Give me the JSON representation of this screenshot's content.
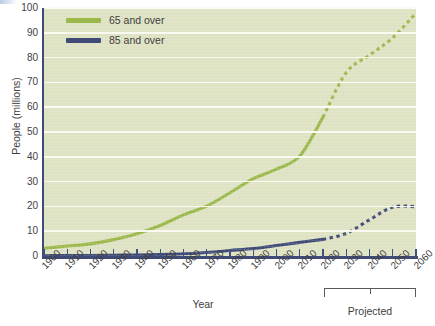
{
  "chart_data": {
    "type": "line",
    "title": "",
    "xlabel": "Year",
    "ylabel": "People (millions)",
    "xlim": [
      1900,
      2060
    ],
    "ylim": [
      0,
      100
    ],
    "grid": true,
    "legend_position": "top-left",
    "x": [
      1900,
      1910,
      1920,
      1930,
      1940,
      1950,
      1960,
      1970,
      1980,
      1990,
      2000,
      2010,
      2020,
      2030,
      2040,
      2050,
      2060
    ],
    "xticklabels": [
      "1900",
      "1910",
      "1920",
      "1930",
      "1940",
      "1950",
      "1960",
      "1970",
      "1980",
      "1990",
      "2000",
      "2010",
      "2020",
      "2030",
      "2040",
      "2050",
      "2060"
    ],
    "yticklabels": [
      "0",
      "10",
      "20",
      "30",
      "40",
      "50",
      "60",
      "70",
      "80",
      "90",
      "100"
    ],
    "yticks": [
      0,
      10,
      20,
      30,
      40,
      50,
      60,
      70,
      80,
      90,
      100
    ],
    "series": [
      {
        "name": "65 and over",
        "color": "#9bb84b",
        "values": [
          3.1,
          4.0,
          4.9,
          6.6,
          9.0,
          12.3,
          16.6,
          20.1,
          25.5,
          31.2,
          35.0,
          40.3,
          56.0,
          74.0,
          81.0,
          88.0,
          98.0
        ],
        "solid_until": 2020,
        "projected_from": 2020,
        "projected_style": "dotted"
      },
      {
        "name": "85 and over",
        "color": "#3f4a76",
        "values": [
          0.1,
          0.2,
          0.2,
          0.3,
          0.4,
          0.6,
          0.9,
          1.4,
          2.2,
          3.0,
          4.2,
          5.5,
          6.7,
          9.1,
          14.6,
          19.7,
          19.9
        ],
        "solid_until": 2020,
        "projected_from": 2020,
        "projected_style": "dotted"
      }
    ],
    "annotations": [
      {
        "text": "Projected",
        "span_start": 2020,
        "span_end": 2060,
        "type": "bracket"
      }
    ],
    "plot_background": "#dee2c3",
    "gridline_color": "#fbfbf4",
    "axis_color": "#3f4a76"
  },
  "legend": {
    "items": [
      {
        "label": "65 and over",
        "color": "#9bb84b"
      },
      {
        "label": "85 and over",
        "color": "#3f4a76"
      }
    ]
  },
  "axes": {
    "y_title": "People (millions)",
    "x_title": "Year",
    "y_ticks": [
      "100",
      "90",
      "80",
      "70",
      "60",
      "50",
      "40",
      "30",
      "20",
      "10",
      "0"
    ],
    "x_ticks": [
      "1900",
      "1910",
      "1920",
      "1930",
      "1940",
      "1950",
      "1960",
      "1970",
      "1980",
      "1990",
      "2000",
      "2010",
      "2020",
      "2030",
      "2040",
      "2050",
      "2060"
    ]
  },
  "annotation": {
    "projected_label": "Projected"
  }
}
